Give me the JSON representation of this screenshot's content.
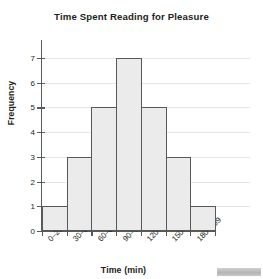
{
  "chart_data": {
    "type": "bar",
    "title": "Time Spent Reading for Pleasure",
    "xlabel": "Time (min)",
    "ylabel": "Frequency",
    "categories": [
      "0–29",
      "30–59",
      "60–89",
      "90–119",
      "120–149",
      "150–179",
      "180–209"
    ],
    "values": [
      1,
      3,
      5,
      7,
      5,
      3,
      1
    ],
    "ylim": [
      0,
      7
    ],
    "ytick_labels": [
      "0",
      "1",
      "2",
      "3",
      "4",
      "5",
      "6",
      "7"
    ],
    "grid": true,
    "legend": false,
    "bar_fill_color": "#ebebeb",
    "bar_border_color": "#585858",
    "gridline_color": "#e6e6e6",
    "axis_color": "#58595b",
    "text_color": "#231f20"
  }
}
